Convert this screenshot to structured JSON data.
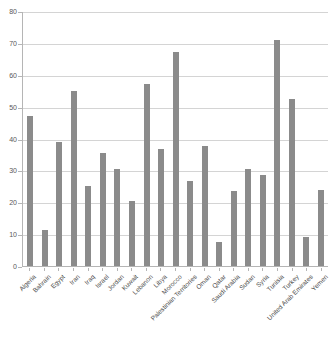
{
  "chart_data": {
    "type": "bar",
    "title": "",
    "subtitle": "",
    "xlabel": "",
    "ylabel": "",
    "ylim": [
      0,
      80
    ],
    "yticks": [
      0,
      10,
      20,
      30,
      40,
      50,
      60,
      70,
      80
    ],
    "grid": true,
    "legend": "none",
    "bar_color": "#8b8b8b",
    "categories": [
      "Algeria",
      "Bahrain",
      "Egypt",
      "Iran",
      "Iraq",
      "Israel",
      "Jordan",
      "Kuwait",
      "Lebanon",
      "Libya",
      "Morocco",
      "Palestinian Territories",
      "Oman",
      "Qatar",
      "Saudi Arabia",
      "Sudan",
      "Syria",
      "Tunisia",
      "Turkey",
      "United Arab Emirates",
      "Yemen"
    ],
    "values": [
      47.0,
      11.3,
      38.8,
      55.0,
      25.0,
      35.3,
      30.3,
      20.3,
      57.0,
      36.6,
      67.0,
      26.8,
      37.5,
      7.6,
      23.4,
      30.4,
      28.5,
      71.0,
      52.3,
      9.1,
      23.9
    ]
  }
}
